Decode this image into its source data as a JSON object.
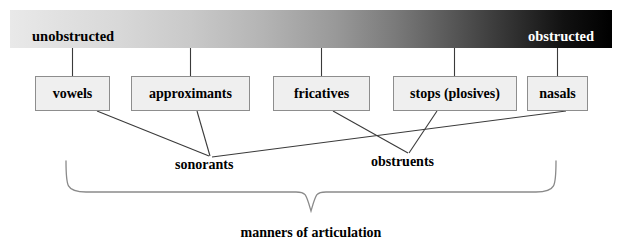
{
  "diagram": {
    "title": "manners of articulation",
    "continuum": {
      "left_label": "unobstructed",
      "right_label": "obstructed",
      "gradient_start_color": "#e9e9e9",
      "gradient_end_color": "#000000",
      "left_text_color": "#000000",
      "right_text_color": "#ffffff"
    },
    "categories": [
      {
        "id": "vowels",
        "label": "vowels"
      },
      {
        "id": "approximants",
        "label": "approximants"
      },
      {
        "id": "fricatives",
        "label": "fricatives"
      },
      {
        "id": "stops",
        "label": "stops (plosives)"
      },
      {
        "id": "nasals",
        "label": "nasals"
      }
    ],
    "groups": [
      {
        "id": "sonorants",
        "label": "sonorants",
        "members": [
          "vowels",
          "approximants",
          "nasals"
        ]
      },
      {
        "id": "obstruents",
        "label": "obstruents",
        "members": [
          "fricatives",
          "stops"
        ]
      }
    ],
    "box_style": {
      "fill": "#efefef",
      "border": "#8d8d8d"
    },
    "line_color": "#3a3a3a",
    "brace_color": "#8a8a8a"
  }
}
